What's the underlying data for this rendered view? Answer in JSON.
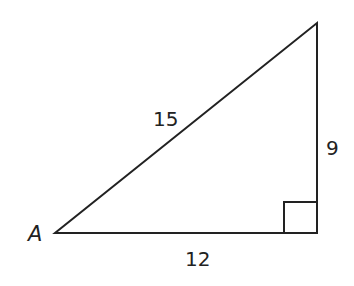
{
  "diagram": {
    "type": "right-triangle",
    "vertex_label": "A",
    "hypotenuse_label": "15",
    "vertical_side_label": "9",
    "horizontal_side_label": "12",
    "right_angle_marker": true,
    "stroke_color": "#222222"
  }
}
